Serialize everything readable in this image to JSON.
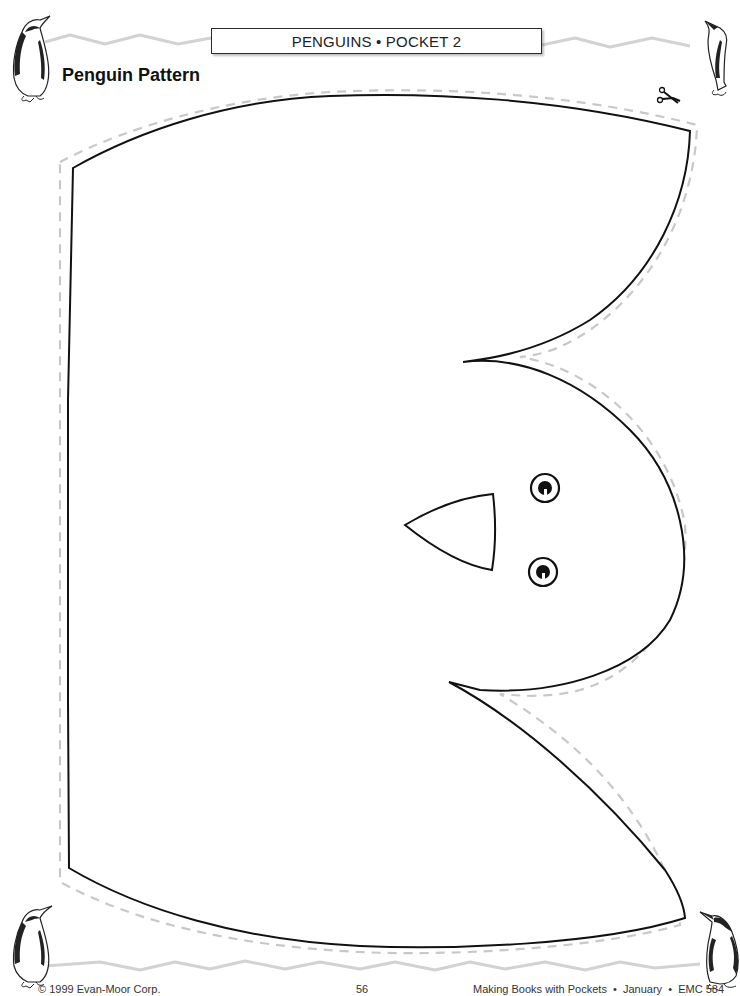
{
  "header": {
    "section_label": "PENGUINS • POCKET 2"
  },
  "page": {
    "title": "Penguin Pattern"
  },
  "pattern": {
    "shape": "penguin-body-with-head",
    "cut_line_style": "dashed",
    "cut_line_color": "#c8c8c8",
    "outline_color": "#111111",
    "features": [
      "beak",
      "left-eye",
      "right-eye"
    ]
  },
  "decorations": {
    "corner_penguins": [
      "top-left",
      "top-right",
      "bottom-left",
      "bottom-right"
    ],
    "scissors_icon": "scissors-icon",
    "zigzag_border_color": "#d0d0d0"
  },
  "footer": {
    "copyright": "© 1999 Evan-Moor Corp.",
    "page_number": "56",
    "book_info": "Making Books with Pockets  •  January  •  EMC 584"
  }
}
